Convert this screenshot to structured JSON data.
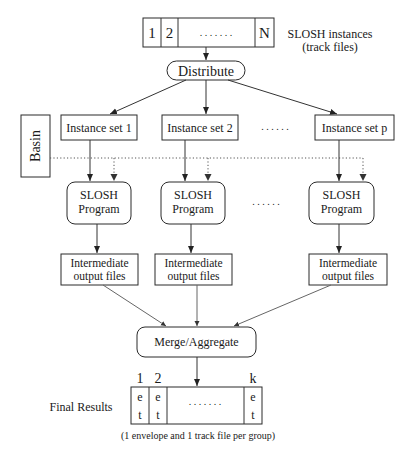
{
  "diagram": {
    "instances": {
      "cells": [
        "1",
        "2",
        ". . . . . . .",
        "N"
      ],
      "label_line1": "SLOSH instances",
      "label_line2": "(track files)"
    },
    "distribute": {
      "label": "Distribute"
    },
    "basin": {
      "label": "Basin"
    },
    "instance_sets": [
      {
        "label": "Instance set 1"
      },
      {
        "label": "Instance set 2"
      },
      {
        "label": "Instance set p"
      }
    ],
    "instance_sets_ellipsis": ". . . . . .",
    "programs": [
      {
        "line1": "SLOSH",
        "line2": "Program"
      },
      {
        "line1": "SLOSH",
        "line2": "Program"
      },
      {
        "line1": "SLOSH",
        "line2": "Program"
      }
    ],
    "programs_ellipsis": ". . . . . .",
    "intermediates": [
      {
        "line1": "Intermediate",
        "line2": "output files"
      },
      {
        "line1": "Intermediate",
        "line2": "output files"
      },
      {
        "line1": "Intermediate",
        "line2": "output files"
      }
    ],
    "merge": {
      "label": "Merge/Aggregate"
    },
    "final": {
      "label": "Final Results",
      "indices": [
        "1",
        "2",
        "k"
      ],
      "cell_top": "e",
      "cell_bottom": "t",
      "ellipsis": ". . . . . . .",
      "caption": "(1 envelope and 1 track file per group)"
    }
  }
}
